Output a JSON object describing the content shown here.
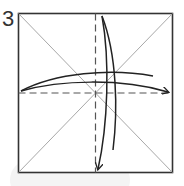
{
  "step": {
    "number": "3"
  },
  "diagram": {
    "type": "origami-fold-instruction",
    "square": {
      "x": 18,
      "y": 13,
      "size": 155
    },
    "colors": {
      "edge": "#333333",
      "crease": "#a8a8a8",
      "valley_fold": "#555555",
      "arrow": "#222222",
      "background_blob": "#f4f4f4"
    },
    "creases": [
      "diagonal-tl-br",
      "diagonal-tr-bl"
    ],
    "valley_folds": [
      "horizontal-center",
      "vertical-center"
    ],
    "arrows": [
      {
        "name": "fold-left-edge-to-right-arrow",
        "direction": "left-to-right"
      },
      {
        "name": "fold-top-edge-to-bottom-arrow",
        "direction": "top-to-bottom"
      }
    ]
  }
}
